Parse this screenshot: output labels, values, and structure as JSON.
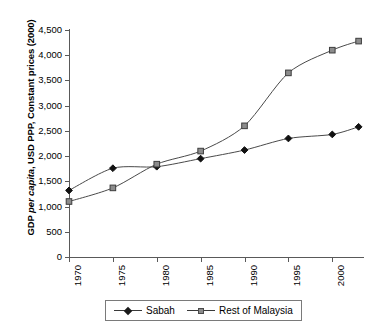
{
  "chart_data": {
    "type": "line",
    "title": "",
    "xlabel": "",
    "ylabel": "GDP per capita, USD PPP, Constant prices (2000)",
    "ylabel_plain": "GDP ",
    "ylabel_italic": "per capita",
    "ylabel_rest": ", USD PPP, Constant prices (2000)",
    "xlim": [
      1970,
      2003.5
    ],
    "ylim": [
      0,
      4500
    ],
    "grid": false,
    "legend_position": "bottom",
    "x_tick_labels": [
      "1970",
      "1975",
      "1980",
      "1985",
      "1990",
      "1995",
      "2000"
    ],
    "x_tick_values": [
      1970,
      1975,
      1980,
      1985,
      1990,
      1995,
      2000
    ],
    "y_tick_labels": [
      "0",
      "500",
      "1,000",
      "1,500",
      "2,000",
      "2,500",
      "3,000",
      "3,500",
      "4,000",
      "4,500"
    ],
    "y_tick_values": [
      0,
      500,
      1000,
      1500,
      2000,
      2500,
      3000,
      3500,
      4000,
      4500
    ],
    "x": [
      1970,
      1975,
      1980,
      1985,
      1990,
      1995,
      2000,
      2003
    ],
    "series": [
      {
        "name": "Sabah",
        "marker": "filled-diamond",
        "color": "#1a1a1a",
        "values": [
          1320,
          1760,
          1790,
          1950,
          2120,
          2350,
          2430,
          2580
        ]
      },
      {
        "name": "Rest of Malaysia",
        "marker": "open-square",
        "color": "#8c8c8c",
        "values": [
          1100,
          1370,
          1840,
          2100,
          2600,
          3650,
          4100,
          4280
        ]
      }
    ]
  },
  "legend": {
    "entries": [
      {
        "label": "Sabah"
      },
      {
        "label": "Rest of Malaysia"
      }
    ]
  }
}
